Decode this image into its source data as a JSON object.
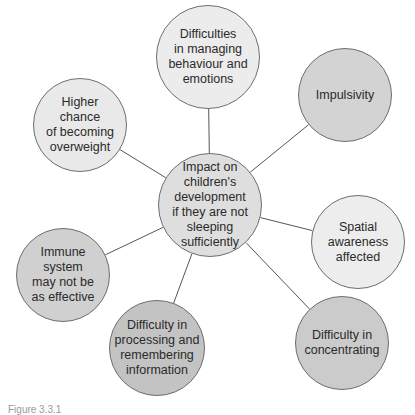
{
  "diagram": {
    "type": "spider-diagram",
    "center": {
      "label": "Impact on\nchildren's\ndevelopment\nif they are not\nsleeping\nsufficiently",
      "x": 210,
      "y": 205,
      "r": 52,
      "fill": "#dedede"
    },
    "nodes": [
      {
        "id": "behaviour",
        "label": "Difficulties\nin managing\nbehaviour and\nemotions",
        "x": 208,
        "y": 57,
        "r": 52,
        "fill": "#ececec"
      },
      {
        "id": "impulsivity",
        "label": "Impulsivity",
        "x": 345,
        "y": 95,
        "r": 47,
        "fill": "#d3d3d3"
      },
      {
        "id": "spatial",
        "label": "Spatial\nawareness\naffected",
        "x": 358,
        "y": 242,
        "r": 47,
        "fill": "#ededed"
      },
      {
        "id": "concentrating",
        "label": "Difficulty in\nconcentrating",
        "x": 342,
        "y": 343,
        "r": 47,
        "fill": "#cbcbcb"
      },
      {
        "id": "processing",
        "label": "Difficulty in\nprocessing and\nremembering\ninformation",
        "x": 157,
        "y": 348,
        "r": 48,
        "fill": "#c3c3c3"
      },
      {
        "id": "immune",
        "label": "Immune\nsystem\nmay not be\nas effective",
        "x": 63,
        "y": 275,
        "r": 47,
        "fill": "#d0d0d0"
      },
      {
        "id": "overweight",
        "label": "Higher\nchance\nof becoming\noverweight",
        "x": 80,
        "y": 125,
        "r": 47,
        "fill": "#e9e9e9"
      }
    ],
    "line_color": "#555555",
    "border_color": "#6e6e6e"
  },
  "caption": "Figure 3.3.1"
}
